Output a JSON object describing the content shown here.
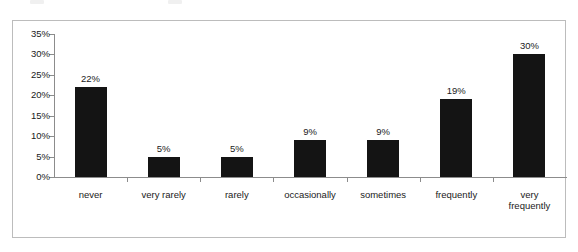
{
  "chart_data": {
    "type": "bar",
    "title": "",
    "xlabel": "",
    "ylabel": "",
    "categories": [
      "never",
      "very rarely",
      "rarely",
      "occasionally",
      "sometimes",
      "frequently",
      "very\nfrequently"
    ],
    "values": [
      22,
      5,
      5,
      9,
      9,
      19,
      30
    ],
    "value_labels": [
      "22%",
      "5%",
      "5%",
      "9%",
      "9%",
      "19%",
      "30%"
    ],
    "ylim": [
      0,
      35
    ],
    "ytick_values": [
      35,
      30,
      25,
      20,
      15,
      10,
      5,
      0
    ],
    "ytick_labels": [
      "35%",
      "30%",
      "25%",
      "20%",
      "15%",
      "10%",
      "5%",
      "0%"
    ],
    "grid": false,
    "legend": null,
    "bar_color": "#141414",
    "axis_color": "#8c8c8c",
    "frame_color": "#bcbcbc",
    "background": "#ffffff"
  }
}
